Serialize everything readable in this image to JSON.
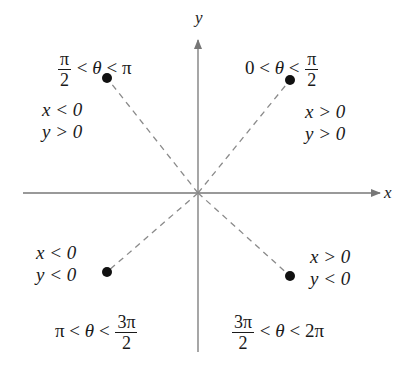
{
  "axes": {
    "x_label": "x",
    "y_label": "y",
    "axis_color": "#777777",
    "guide_color": "#8a8a8a"
  },
  "quadrants": [
    {
      "id": "Q1",
      "angle_range": {
        "left": "0",
        "op1": "<",
        "var": "θ",
        "op2": "<",
        "right_num": "π",
        "right_den": "2"
      },
      "conditions": [
        "x > 0",
        "y > 0"
      ],
      "point": {
        "x": 290,
        "y": 80
      }
    },
    {
      "id": "Q2",
      "angle_range": {
        "left_num": "π",
        "left_den": "2",
        "op1": "<",
        "var": "θ",
        "op2": "<",
        "right": "π"
      },
      "conditions": [
        "x < 0",
        "y > 0"
      ],
      "point": {
        "x": 107,
        "y": 78
      }
    },
    {
      "id": "Q3",
      "angle_range": {
        "left": "π",
        "op1": "<",
        "var": "θ",
        "op2": "<",
        "right_num": "3π",
        "right_den": "2"
      },
      "conditions": [
        "x < 0",
        "y < 0"
      ],
      "point": {
        "x": 107,
        "y": 272
      }
    },
    {
      "id": "Q4",
      "angle_range": {
        "left_num": "3π",
        "left_den": "2",
        "op1": "<",
        "var": "θ",
        "op2": "<",
        "right": "2π"
      },
      "conditions": [
        "x > 0",
        "y < 0"
      ],
      "point": {
        "x": 290,
        "y": 276
      }
    }
  ]
}
